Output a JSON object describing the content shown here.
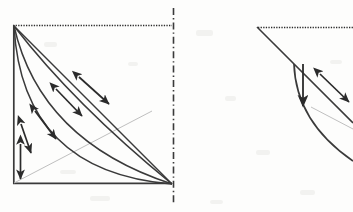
{
  "figure": {
    "background_color": "#fdfdfc",
    "ink_color": "#2b2b2b",
    "faint_line_color": "#b9b9b9",
    "panel_count": 2
  },
  "panels": [
    {
      "id": "left-panel",
      "name": "main-square-panel",
      "frame": {
        "x": 13,
        "y": 25,
        "width": 159,
        "height": 159,
        "top_edge_style": "dotted",
        "left_edge_style": "solid",
        "bottom_edge_style": "solid",
        "right_edge_style": "none"
      },
      "axis_marker": {
        "name": "dash-dot-vertical-axis",
        "x": 173,
        "y_start": 8,
        "y_end": 205,
        "style": "dash-dot"
      },
      "straight_diagonal": {
        "name": "reference-diagonal",
        "from": [
          13,
          25
        ],
        "to": [
          172,
          184
        ],
        "style": "solid"
      },
      "faint_diagonal": {
        "name": "faint-guide-diagonal",
        "from": [
          14,
          183
        ],
        "to": [
          150,
          112
        ],
        "style": "solid-light"
      },
      "curves": [
        {
          "name": "curve-outer",
          "from": [
            13,
            25
          ],
          "to": [
            172,
            184
          ],
          "control": [
            74,
            104
          ],
          "curvature": "mild"
        },
        {
          "name": "curve-middle",
          "from": [
            13,
            25
          ],
          "to": [
            172,
            184
          ],
          "control": [
            40,
            140
          ],
          "curvature": "moderate"
        },
        {
          "name": "curve-inner",
          "from": [
            13,
            25
          ],
          "to": [
            172,
            184
          ],
          "control": [
            22,
            172
          ],
          "curvature": "strong"
        }
      ],
      "arrows": [
        {
          "name": "arrow-pair-1",
          "heads": "double",
          "from": [
            78,
            76
          ],
          "to": [
            110,
            104
          ],
          "orientation": "diagonal-down-right"
        },
        {
          "name": "arrow-pair-2",
          "heads": "double",
          "from": [
            55,
            88
          ],
          "to": [
            83,
            117
          ],
          "orientation": "diagonal-down-right"
        },
        {
          "name": "arrow-pair-3",
          "heads": "double",
          "from": [
            34,
            110
          ],
          "to": [
            57,
            140
          ],
          "orientation": "diagonal-down-right"
        },
        {
          "name": "arrow-pair-4",
          "heads": "double",
          "from": [
            20,
            123
          ],
          "to": [
            32,
            154
          ],
          "orientation": "diagonal-down-right"
        },
        {
          "name": "arrow-pair-5",
          "heads": "double",
          "from": [
            20,
            143
          ],
          "to": [
            20,
            180
          ],
          "orientation": "vertical"
        }
      ]
    },
    {
      "id": "right-panel",
      "name": "cropped-detail-panel",
      "frame": {
        "x": 255,
        "y": 26,
        "clipped": true,
        "top_edge_style": "dotted"
      },
      "dotted_edge": {
        "name": "dotted-top-edge",
        "from": [
          258,
          27
        ],
        "to": [
          353,
          27
        ]
      },
      "straight_diagonal": {
        "name": "cropped-reference-diagonal",
        "from": [
          257,
          27
        ],
        "to": [
          353,
          123
        ],
        "style": "solid"
      },
      "curve": {
        "name": "cropped-curve",
        "from": [
          294,
          64
        ],
        "to": [
          353,
          160
        ],
        "control": [
          296,
          122
        ],
        "style": "solid"
      },
      "faint_diagonal": {
        "name": "cropped-faint-guide",
        "from": [
          312,
          108
        ],
        "to": [
          353,
          130
        ],
        "style": "solid-light"
      },
      "arrows": [
        {
          "name": "arrow-down-vertical",
          "heads": "single",
          "from": [
            303,
            64
          ],
          "to": [
            303,
            107
          ],
          "orientation": "vertical-down"
        },
        {
          "name": "arrow-pair-diagonal",
          "heads": "double",
          "from": [
            319,
            73
          ],
          "to": [
            350,
            103
          ],
          "orientation": "diagonal-down-right"
        }
      ]
    }
  ],
  "labels": [],
  "legend": []
}
